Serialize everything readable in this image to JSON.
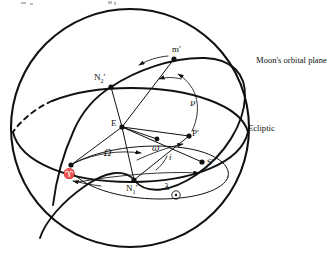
{
  "figure": {
    "background_color": "#ffffff",
    "line_color": "#111111",
    "width": 328,
    "height": 256
  },
  "sphere": {
    "name": "celestial-sphere",
    "center_x": 130,
    "center_y": 128,
    "radius": 119
  },
  "planes": [
    {
      "id": "ecliptic",
      "label": "Ecliptic",
      "label_x": 248,
      "label_y": 131,
      "description": "great circle of the ecliptic plane, front arc solid and rear arc dashed"
    },
    {
      "id": "moon-orbit",
      "label": "Moon's orbital plane",
      "label_x": 256,
      "label_y": 63,
      "description": "great circle of the Moon's orbital plane inclined to the ecliptic"
    }
  ],
  "points": [
    {
      "id": "ascending-node",
      "label": "N",
      "subscript": "1",
      "prime": "′",
      "x": 134,
      "y": 180,
      "label_x": 126,
      "label_y": 191,
      "meaning": "ascending node"
    },
    {
      "id": "descending-node",
      "label": "N",
      "subscript": "2",
      "prime": "′",
      "x": 111,
      "y": 87,
      "label_x": 94,
      "label_y": 80,
      "meaning": "descending node"
    },
    {
      "id": "earth-center",
      "label": "E",
      "prime": "",
      "x": 122,
      "y": 127,
      "label_x": 111,
      "label_y": 126,
      "meaning": "Earth at the centre of the sphere"
    },
    {
      "id": "moon",
      "label": "m",
      "prime": "′",
      "x": 174,
      "y": 59,
      "label_x": 172,
      "label_y": 52,
      "meaning": "Moon"
    },
    {
      "id": "perigee",
      "label": "P",
      "prime": "′",
      "x": 189,
      "y": 136,
      "label_x": 192,
      "label_y": 136,
      "meaning": "perigee of the lunar orbit"
    },
    {
      "id": "sun-direction",
      "label": "S",
      "prime": "′",
      "x": 202,
      "y": 162,
      "label_x": 207,
      "label_y": 165,
      "meaning": "direction of the Sun"
    },
    {
      "id": "vernal-equinox",
      "label": "♈",
      "prime": "",
      "x": 71,
      "y": 165,
      "label_x": 63,
      "label_y": 177,
      "meaning": "First point of Aries (vernal equinox)"
    },
    {
      "id": "perigee-arc-point",
      "label": "",
      "prime": "",
      "x": 157,
      "y": 139,
      "label_x": 0,
      "label_y": 0,
      "meaning": "point on the arc used for the argument of perigee"
    }
  ],
  "angles": [
    {
      "id": "longitude-of-node",
      "symbol": "Ω",
      "x": 104,
      "y": 156,
      "meaning": "longitude of the ascending node measured along the ecliptic from Aries"
    },
    {
      "id": "argument-of-perigee",
      "symbol": "ω",
      "x": 152,
      "y": 151,
      "meaning": "argument of perigee measured in the orbital plane from the ascending node"
    },
    {
      "id": "true-anomaly",
      "symbol": "ν",
      "x": 190,
      "y": 106,
      "meaning": "true anomaly of the Moon measured from perigee"
    },
    {
      "id": "inclination",
      "symbol": "i",
      "x": 169,
      "y": 160,
      "meaning": "inclination of the Moon's orbital plane to the ecliptic"
    },
    {
      "id": "solar-longitude",
      "symbol": "λ",
      "x": 164,
      "y": 190,
      "meaning": "celestial longitude of the Sun"
    }
  ],
  "symbols": [
    {
      "id": "sun-symbol",
      "glyph": "⊙",
      "x": 176,
      "y": 197,
      "meaning": "Sun symbol attached to the solar longitude lambda"
    }
  ]
}
